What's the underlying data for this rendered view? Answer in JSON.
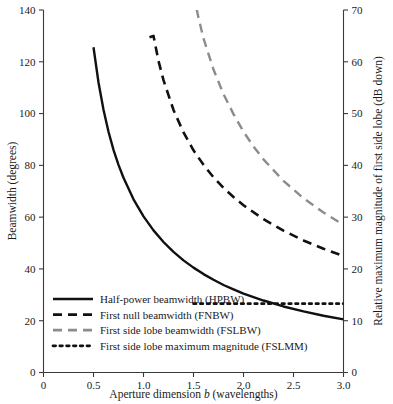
{
  "chart_data": {
    "type": "line",
    "title": "",
    "xlabel": "Aperture dimension b (wavelengths)",
    "xlabel_pre": "Aperture dimension ",
    "xlabel_italic": "b",
    "xlabel_post": " (wavelengths)",
    "ylabel": "Beamwidth (degrees)",
    "ylabel_right": "Relative maximum magnitude of first side lobe (dB down)",
    "xlim": [
      0,
      3.0
    ],
    "ylim": [
      0,
      140
    ],
    "ylim_right": [
      0,
      70
    ],
    "xticks": [
      0,
      0.5,
      1.0,
      1.5,
      2.0,
      2.5,
      3.0
    ],
    "xtick_labels": [
      "0",
      "0.5",
      "1.0",
      "1.5",
      "2.0",
      "2.5",
      "3.0"
    ],
    "yticks": [
      0,
      20,
      40,
      60,
      80,
      100,
      120,
      140
    ],
    "ytick_labels": [
      "0",
      "20",
      "40",
      "60",
      "80",
      "100",
      "120",
      "140"
    ],
    "yticks_right": [
      0,
      10,
      20,
      30,
      40,
      50,
      60,
      70
    ],
    "ytick_labels_right": [
      "0",
      "10",
      "20",
      "30",
      "40",
      "50",
      "60",
      "70"
    ],
    "grid": false,
    "legend_position": "lower-left-inside",
    "series": [
      {
        "name": "Half-power beamwidth (HPBW)",
        "key": "hpbw",
        "axis": "left",
        "style": "solid",
        "color": "#111111",
        "width": 2.4,
        "x": [
          0.5,
          0.55,
          0.6,
          0.65,
          0.7,
          0.75,
          0.8,
          0.9,
          1.0,
          1.1,
          1.2,
          1.3,
          1.4,
          1.5,
          1.6,
          1.7,
          1.8,
          1.9,
          2.0,
          2.2,
          2.4,
          2.6,
          2.8,
          3.0
        ],
        "y": [
          125.6,
          112.0,
          101.5,
          93.0,
          86.0,
          80.2,
          75.2,
          66.9,
          60.3,
          54.9,
          50.4,
          46.6,
          43.3,
          40.5,
          38.0,
          35.8,
          33.8,
          32.1,
          30.5,
          27.8,
          25.5,
          23.6,
          21.9,
          20.5
        ],
        "y_note": "HPBW = 2*asin(0.4429*lambda/b) in degrees"
      },
      {
        "name": "First null beamwidth (FNBW)",
        "key": "fnbw",
        "axis": "left",
        "style": "dashed",
        "color": "#111111",
        "width": 2.6,
        "x": [
          1.06,
          1.1,
          1.15,
          1.2,
          1.3,
          1.4,
          1.5,
          1.6,
          1.7,
          1.8,
          1.9,
          2.0,
          2.2,
          2.4,
          2.6,
          2.8,
          3.0
        ],
        "y": [
          129.5,
          130.0,
          120.3,
          112.9,
          101.4,
          92.7,
          85.8,
          80.2,
          75.4,
          71.3,
          67.8,
          64.6,
          59.2,
          54.8,
          51.0,
          47.8,
          45.0
        ],
        "y_note": "FNBW = 2*asin(lambda/b) in degrees, from b=1.0"
      },
      {
        "name": "First side lobe beamwidth (FSLBW)",
        "key": "fslbw",
        "axis": "left",
        "style": "dashed-gray",
        "color": "#8c8c8c",
        "width": 2.4,
        "x": [
          1.5,
          1.55,
          1.6,
          1.7,
          1.8,
          1.9,
          2.0,
          2.1,
          2.2,
          2.4,
          2.6,
          2.8,
          3.0
        ],
        "y": [
          146.0,
          137.0,
          129.0,
          117.0,
          107.5,
          99.8,
          93.0,
          87.3,
          82.3,
          74.0,
          67.3,
          61.8,
          57.0
        ],
        "y_note": "FSLBW curve enters plot top at b~1.53"
      },
      {
        "name": "First side lobe maximum magnitude (FSLMM)",
        "key": "fslmm",
        "axis": "right",
        "style": "dotted",
        "color": "#111111",
        "width": 2.6,
        "x": [
          1.5,
          3.0
        ],
        "y_right": [
          13.3,
          13.3
        ],
        "y_note": "Constant 13.3 dB down, plotted on right axis from b=1.5 to 3.0"
      }
    ],
    "legend": [
      {
        "label": "Half-power beamwidth (HPBW)",
        "style": "solid",
        "color": "#111111"
      },
      {
        "label": "First null beamwidth (FNBW)",
        "style": "dashed",
        "color": "#111111"
      },
      {
        "label": "First side lobe beamwidth (FSLBW)",
        "style": "dashed-gray",
        "color": "#8c8c8c"
      },
      {
        "label": "First side lobe maximum magnitude (FSLMM)",
        "style": "dotted",
        "color": "#111111"
      }
    ]
  }
}
